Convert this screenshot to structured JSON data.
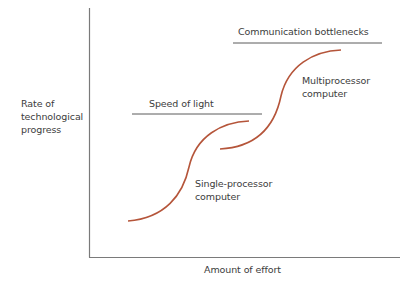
{
  "diagram": {
    "y_axis_label": {
      "line1": "Rate of",
      "line2": "technological",
      "line3": "progress"
    },
    "x_axis_label": "Amount of effort",
    "limits": [
      {
        "label": "Speed of light"
      },
      {
        "label": "Communication bottlenecks"
      }
    ],
    "curves": [
      {
        "label_line1": "Single-processor",
        "label_line2": "computer"
      },
      {
        "label_line1": "Multiprocessor",
        "label_line2": "computer"
      }
    ],
    "colors": {
      "axis": "#7a7a7a",
      "limit_line": "#5a5a5a",
      "curve": "#b5553a",
      "text": "#3c3c3c"
    }
  }
}
